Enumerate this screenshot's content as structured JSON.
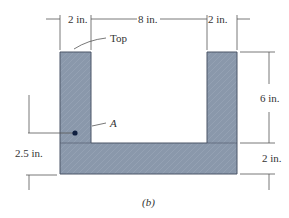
{
  "figure": {
    "caption": "(b)",
    "colors": {
      "fill": "#8a98ab",
      "edge": "#4a5566",
      "line": "#555555",
      "point": "#102040"
    },
    "labels": {
      "top": "Top",
      "point": "A"
    },
    "dimensions": {
      "left_flange_width": "2 in.",
      "gap_width": "8 in.",
      "right_flange_width": "2 in.",
      "flange_height": "6 in.",
      "web_height": "2 in.",
      "point_height": "2.5 in."
    }
  }
}
